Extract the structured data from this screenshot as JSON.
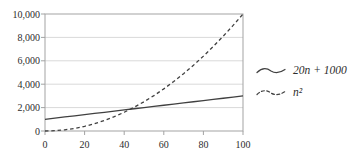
{
  "chart_data": {
    "type": "line",
    "title": "",
    "xlabel": "",
    "ylabel": "",
    "xlim": [
      0,
      100
    ],
    "ylim": [
      0,
      10000
    ],
    "xticks": [
      0,
      20,
      40,
      60,
      80,
      100
    ],
    "xtick_labels": [
      "0",
      "20",
      "40",
      "60",
      "80",
      "100"
    ],
    "yticks": [
      0,
      2000,
      4000,
      6000,
      8000,
      10000
    ],
    "ytick_labels": [
      "0",
      "2,000",
      "4,000",
      "6,000",
      "8,000",
      "10,000"
    ],
    "grid": "horizontal",
    "legend_position": "right-outside",
    "x": [
      0,
      5,
      10,
      15,
      20,
      25,
      30,
      35,
      40,
      45,
      50,
      55,
      60,
      65,
      70,
      75,
      80,
      85,
      90,
      95,
      100
    ],
    "series": [
      {
        "name": "20n + 1000",
        "line_style": "solid",
        "values": [
          1000,
          1100,
          1200,
          1300,
          1400,
          1500,
          1600,
          1700,
          1800,
          1900,
          2000,
          2100,
          2200,
          2300,
          2400,
          2500,
          2600,
          2700,
          2800,
          2900,
          3000
        ]
      },
      {
        "name": "n²",
        "line_style": "dashed",
        "values": [
          0,
          25,
          100,
          225,
          400,
          625,
          900,
          1225,
          1600,
          2025,
          2500,
          3025,
          3600,
          4225,
          4900,
          5625,
          6400,
          7225,
          8100,
          9025,
          10000
        ]
      }
    ],
    "colors": {
      "line": "#404040",
      "grid": "#d9d9d9",
      "spine": "#a3a3a3",
      "tick_text": "#2d2d2d",
      "background": "#ffffff"
    }
  }
}
